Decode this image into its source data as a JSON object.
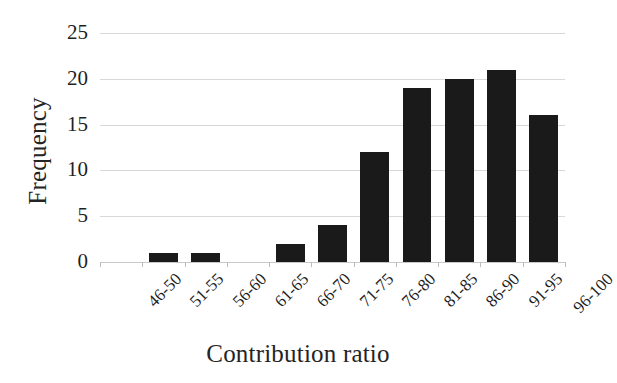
{
  "chart_data": {
    "type": "bar",
    "title": "",
    "subtitle": "",
    "xlabel": "Contribution ratio",
    "ylabel": "Frequency",
    "categories": [
      "46-50",
      "51-55",
      "56-60",
      "61-65",
      "66-70",
      "71-75",
      "76-80",
      "81-85",
      "86-90",
      "91-95",
      "96-100"
    ],
    "values": [
      0,
      1,
      1,
      0,
      2,
      4,
      12,
      19,
      20,
      21,
      16
    ],
    "ylim": [
      0,
      25
    ],
    "ytick_labels": [
      "25",
      "20",
      "15",
      "10",
      "5",
      "0"
    ],
    "ytick_values": [
      25,
      20,
      15,
      10,
      5,
      0
    ],
    "grid": "horizontal",
    "legend": "none",
    "bar_color": "#1a1a1a",
    "gridline_color": "#d8d8d8",
    "background_color": "#ffffff",
    "xtick_label_rotation": -45
  }
}
